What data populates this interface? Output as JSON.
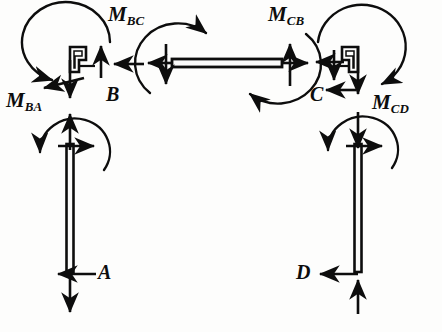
{
  "figure": {
    "width": 442,
    "height": 332,
    "background_color": "#fdfdfc",
    "ink_color": "#0d0d0d"
  },
  "labels": {
    "m_bc": {
      "base": "M",
      "sub": "BC",
      "x": 108,
      "y": 4
    },
    "m_cb": {
      "base": "M",
      "sub": "CB",
      "x": 268,
      "y": 4
    },
    "m_ba": {
      "base": "M",
      "sub": "BA",
      "x": 6,
      "y": 90
    },
    "m_cd": {
      "base": "M",
      "sub": "CD",
      "x": 372,
      "y": 92
    },
    "joint_b": {
      "text": "B",
      "x": 106,
      "y": 85
    },
    "joint_c": {
      "text": "C",
      "x": 310,
      "y": 85
    },
    "support_a": {
      "text": "A",
      "x": 98,
      "y": 262
    },
    "support_d": {
      "text": "D",
      "x": 296,
      "y": 262
    }
  },
  "members": {
    "left_column": {
      "name": "column AB",
      "x": 70,
      "y_top": 144,
      "y_bottom": 272,
      "thickness": 7
    },
    "right_column": {
      "name": "column DC",
      "x": 358,
      "y_top": 144,
      "y_bottom": 272,
      "thickness": 7
    },
    "beam": {
      "name": "beam BC",
      "x_left": 172,
      "x_right": 282,
      "y": 63,
      "thickness": 8
    }
  },
  "joints": {
    "b": {
      "name": "joint block B",
      "x": 66,
      "y": 48,
      "shape": "stepped-L"
    },
    "c": {
      "name": "joint block C",
      "x": 348,
      "y": 48,
      "shape": "stepped-L"
    }
  },
  "moment_arcs": [
    {
      "name": "moment-arc-MBC-joint",
      "location": "joint B",
      "sense": "counterclockwise"
    },
    {
      "name": "moment-arc-MBA-column",
      "location": "top of column AB",
      "sense": "counterclockwise"
    },
    {
      "name": "moment-arc-beam-left",
      "location": "beam left end",
      "sense": "clockwise"
    },
    {
      "name": "moment-arc-beam-right",
      "location": "beam right end",
      "sense": "clockwise"
    },
    {
      "name": "moment-arc-MCB-joint",
      "location": "joint C",
      "sense": "counterclockwise"
    },
    {
      "name": "moment-arc-MCD-column",
      "location": "top of column DC",
      "sense": "counterclockwise"
    }
  ],
  "force_arrows": [
    {
      "name": "force-arrow-joint-b-up",
      "direction": "up",
      "at": "joint B right side"
    },
    {
      "name": "force-arrow-joint-b-left",
      "direction": "left",
      "at": "joint B from beam"
    },
    {
      "name": "force-arrow-joint-b-down",
      "direction": "down",
      "at": "joint B bottom"
    },
    {
      "name": "force-arrow-joint-b-left-lower",
      "direction": "left",
      "at": "joint B lower"
    },
    {
      "name": "force-arrow-beam-left-down",
      "direction": "down",
      "at": "beam left end"
    },
    {
      "name": "force-arrow-beam-left-out",
      "direction": "left",
      "at": "beam left end"
    },
    {
      "name": "force-arrow-beam-right-up",
      "direction": "up",
      "at": "beam right end"
    },
    {
      "name": "force-arrow-beam-right-out",
      "direction": "right",
      "at": "beam right end"
    },
    {
      "name": "force-arrow-joint-c-down",
      "direction": "down",
      "at": "joint C left"
    },
    {
      "name": "force-arrow-joint-c-left",
      "direction": "left",
      "at": "joint C upper"
    },
    {
      "name": "force-arrow-joint-c-down-inner",
      "direction": "down",
      "at": "joint C inner"
    },
    {
      "name": "force-arrow-joint-c-left-lower",
      "direction": "left",
      "at": "joint C lower"
    },
    {
      "name": "force-arrow-column-ab-top-up",
      "direction": "up",
      "at": "top of column AB"
    },
    {
      "name": "force-arrow-column-ab-top-right",
      "direction": "right",
      "at": "top of column AB"
    },
    {
      "name": "force-arrow-column-dc-top-down",
      "direction": "down",
      "at": "top of column DC"
    },
    {
      "name": "force-arrow-column-dc-top-right",
      "direction": "right",
      "at": "top of column DC"
    },
    {
      "name": "force-arrow-support-a-left",
      "direction": "left",
      "at": "support A"
    },
    {
      "name": "force-arrow-support-a-down",
      "direction": "down",
      "at": "support A"
    },
    {
      "name": "force-arrow-support-d-left",
      "direction": "left",
      "at": "support D"
    },
    {
      "name": "force-arrow-support-d-up",
      "direction": "up",
      "at": "support D"
    }
  ]
}
